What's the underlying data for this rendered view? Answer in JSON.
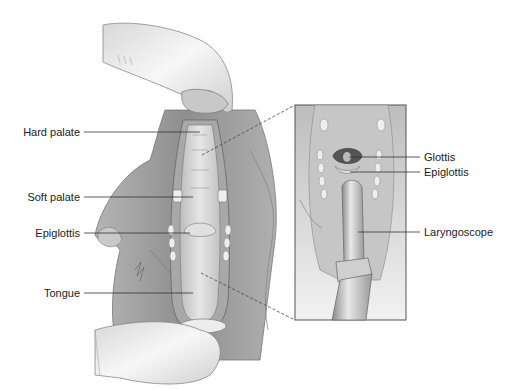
{
  "figure": {
    "left_labels": [
      {
        "text": "Hard palate",
        "y": 132
      },
      {
        "text": "Soft palate",
        "y": 197
      },
      {
        "text": "Epiglottis",
        "y": 233
      },
      {
        "text": "Tongue",
        "y": 293
      }
    ],
    "inset_labels": [
      {
        "text": "Glottis",
        "y": 157
      },
      {
        "text": "Epiglottis",
        "y": 172
      },
      {
        "text": "Laryngoscope",
        "y": 232
      }
    ],
    "colors": {
      "line": "#333333",
      "skin": "#d0d0d0",
      "fur": "#9a9a9a",
      "glove": "#eeeeee",
      "inset_border": "#555555"
    }
  }
}
